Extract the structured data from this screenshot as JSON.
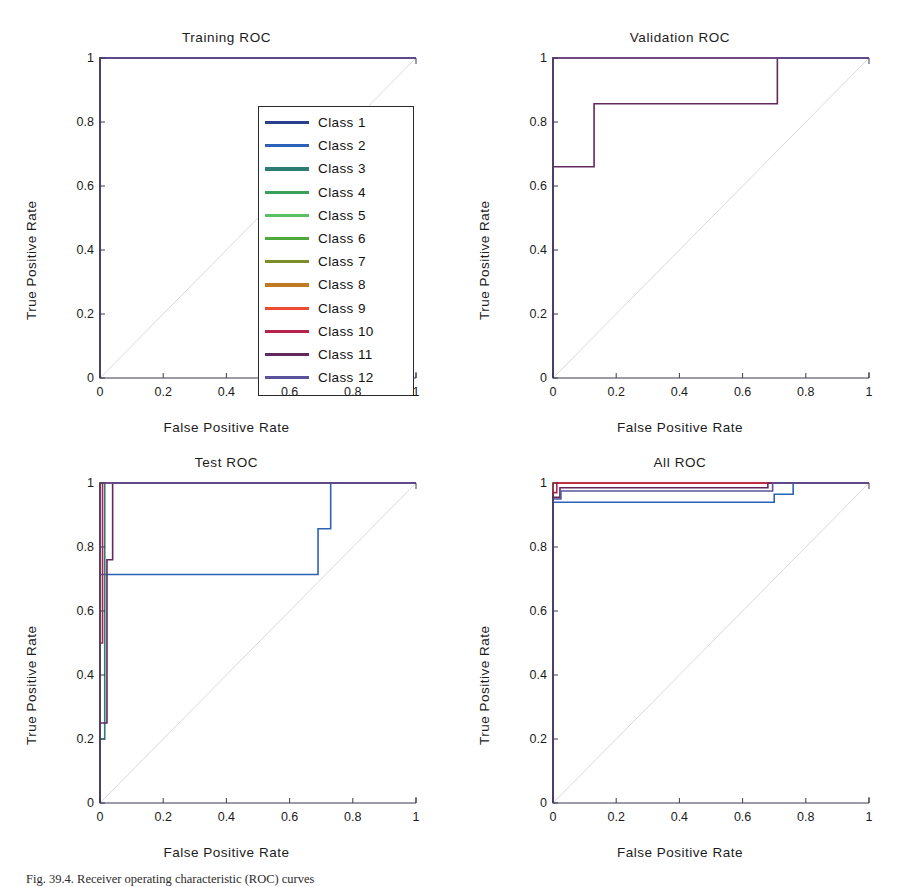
{
  "figure": {
    "caption": "Fig. 39.4. Receiver operating characteristic (ROC) curves",
    "width": 907,
    "height": 885
  },
  "axes": {
    "xlabel": "False Positive Rate",
    "ylabel": "True Positive Rate",
    "xticks": [
      "0",
      "0.2",
      "0.4",
      "0.6",
      "0.8",
      "1"
    ],
    "yticks": [
      "0",
      "0.2",
      "0.4",
      "0.6",
      "0.8",
      "1"
    ],
    "xlim": [
      0,
      1
    ],
    "ylim": [
      0,
      1
    ]
  },
  "legend": {
    "title": "",
    "items": [
      {
        "label": "Class 1",
        "color": "#2a3f8f"
      },
      {
        "label": "Class 2",
        "color": "#2b62b8"
      },
      {
        "label": "Class 3",
        "color": "#2e7d72"
      },
      {
        "label": "Class 4",
        "color": "#3aa05a"
      },
      {
        "label": "Class 5",
        "color": "#5cbf63"
      },
      {
        "label": "Class 6",
        "color": "#4fa83c"
      },
      {
        "label": "Class 7",
        "color": "#7b8c2a"
      },
      {
        "label": "Class 8",
        "color": "#c07a22"
      },
      {
        "label": "Class 9",
        "color": "#ef4b32"
      },
      {
        "label": "Class 10",
        "color": "#b5224c"
      },
      {
        "label": "Class 11",
        "color": "#62295e"
      },
      {
        "label": "Class 12",
        "color": "#5a539a"
      }
    ]
  },
  "chart_data": [
    {
      "id": "training",
      "type": "line",
      "title": "Training ROC",
      "xlabel": "False Positive Rate",
      "ylabel": "True Positive Rate",
      "xlim": [
        0,
        1
      ],
      "ylim": [
        0,
        1
      ],
      "grid": false,
      "legend_position": "inside-right",
      "diagonal_reference": true,
      "note": "All 12 class ROC curves are perfect: TPR jumps to 1 at FPR 0 and stays at 1.",
      "series": [
        {
          "name": "Class 1",
          "color": "#2a3f8f",
          "x": [
            0,
            0,
            1
          ],
          "y": [
            0,
            1,
            1
          ]
        },
        {
          "name": "Class 2",
          "color": "#2b62b8",
          "x": [
            0,
            0,
            1
          ],
          "y": [
            0,
            1,
            1
          ]
        },
        {
          "name": "Class 3",
          "color": "#2e7d72",
          "x": [
            0,
            0,
            1
          ],
          "y": [
            0,
            1,
            1
          ]
        },
        {
          "name": "Class 4",
          "color": "#3aa05a",
          "x": [
            0,
            0,
            1
          ],
          "y": [
            0,
            1,
            1
          ]
        },
        {
          "name": "Class 5",
          "color": "#5cbf63",
          "x": [
            0,
            0,
            1
          ],
          "y": [
            0,
            1,
            1
          ]
        },
        {
          "name": "Class 6",
          "color": "#4fa83c",
          "x": [
            0,
            0,
            1
          ],
          "y": [
            0,
            1,
            1
          ]
        },
        {
          "name": "Class 7",
          "color": "#7b8c2a",
          "x": [
            0,
            0,
            1
          ],
          "y": [
            0,
            1,
            1
          ]
        },
        {
          "name": "Class 8",
          "color": "#c07a22",
          "x": [
            0,
            0,
            1
          ],
          "y": [
            0,
            1,
            1
          ]
        },
        {
          "name": "Class 9",
          "color": "#ef4b32",
          "x": [
            0,
            0,
            1
          ],
          "y": [
            0,
            1,
            1
          ]
        },
        {
          "name": "Class 10",
          "color": "#b5224c",
          "x": [
            0,
            0,
            1
          ],
          "y": [
            0,
            1,
            1
          ]
        },
        {
          "name": "Class 11",
          "color": "#62295e",
          "x": [
            0,
            0,
            1
          ],
          "y": [
            0,
            1,
            1
          ]
        },
        {
          "name": "Class 12",
          "color": "#5a539a",
          "x": [
            0,
            0,
            1
          ],
          "y": [
            0,
            1,
            1
          ]
        }
      ]
    },
    {
      "id": "validation",
      "type": "line",
      "title": "Validation ROC",
      "xlabel": "False Positive Rate",
      "ylabel": "True Positive Rate",
      "xlim": [
        0,
        1
      ],
      "ylim": [
        0,
        1
      ],
      "grid": false,
      "legend_position": "none",
      "diagonal_reference": true,
      "note": "Most classes are perfect; Class 10 rises 0.66 -> 1 at FPR 0.13; Class 11 holds 0.857 until FPR 0.71.",
      "series": [
        {
          "name": "Class 1",
          "color": "#2a3f8f",
          "x": [
            0,
            0,
            1
          ],
          "y": [
            0,
            1,
            1
          ]
        },
        {
          "name": "Class 2",
          "color": "#2b62b8",
          "x": [
            0,
            0,
            1
          ],
          "y": [
            0,
            1,
            1
          ]
        },
        {
          "name": "Class 3",
          "color": "#2e7d72",
          "x": [
            0,
            0,
            1
          ],
          "y": [
            0,
            1,
            1
          ]
        },
        {
          "name": "Class 4",
          "color": "#3aa05a",
          "x": [
            0,
            0,
            1
          ],
          "y": [
            0,
            1,
            1
          ]
        },
        {
          "name": "Class 5",
          "color": "#5cbf63",
          "x": [
            0,
            0,
            1
          ],
          "y": [
            0,
            1,
            1
          ]
        },
        {
          "name": "Class 6",
          "color": "#4fa83c",
          "x": [
            0,
            0,
            1
          ],
          "y": [
            0,
            1,
            1
          ]
        },
        {
          "name": "Class 7",
          "color": "#7b8c2a",
          "x": [
            0,
            0,
            1
          ],
          "y": [
            0,
            1,
            1
          ]
        },
        {
          "name": "Class 8",
          "color": "#c07a22",
          "x": [
            0,
            0,
            1
          ],
          "y": [
            0,
            1,
            1
          ]
        },
        {
          "name": "Class 9",
          "color": "#ef4b32",
          "x": [
            0,
            0,
            1
          ],
          "y": [
            0,
            1,
            1
          ]
        },
        {
          "name": "Class 10",
          "color": "#b5224c",
          "x": [
            0,
            0,
            0,
            0.13,
            0.13,
            1
          ],
          "y": [
            0,
            0.66,
            1,
            1,
            1,
            1
          ]
        },
        {
          "name": "Class 11",
          "color": "#62295e",
          "x": [
            0,
            0,
            0.13,
            0.13,
            0.71,
            0.71,
            1
          ],
          "y": [
            0,
            0.66,
            0.66,
            0.857,
            0.857,
            1,
            1
          ]
        },
        {
          "name": "Class 12",
          "color": "#5a539a",
          "x": [
            0,
            0,
            1
          ],
          "y": [
            0,
            1,
            1
          ]
        }
      ]
    },
    {
      "id": "test",
      "type": "line",
      "title": "Test ROC",
      "xlabel": "False Positive Rate",
      "ylabel": "True Positive Rate",
      "xlim": [
        0,
        1
      ],
      "ylim": [
        0,
        1
      ],
      "grid": false,
      "legend_position": "none",
      "diagonal_reference": true,
      "note": "Class 2 plateaus at 0.714 until FPR 0.69, steps to 0.857, then to 1 at FPR 0.73. Several classes start at 0.2-0.5 and climb steeply near FPR 0.",
      "series": [
        {
          "name": "Class 1",
          "color": "#2a3f8f",
          "x": [
            0,
            0,
            1
          ],
          "y": [
            0,
            1,
            1
          ]
        },
        {
          "name": "Class 2",
          "color": "#2b62b8",
          "x": [
            0,
            0,
            0.04,
            0.04,
            0.69,
            0.69,
            0.73,
            0.73,
            1
          ],
          "y": [
            0,
            0.714,
            0.714,
            0.714,
            0.714,
            0.857,
            0.857,
            1,
            1
          ]
        },
        {
          "name": "Class 3",
          "color": "#2e7d72",
          "x": [
            0,
            0,
            0.015,
            0.015,
            1
          ],
          "y": [
            0,
            0.2,
            0.2,
            1,
            1
          ]
        },
        {
          "name": "Class 4",
          "color": "#3aa05a",
          "x": [
            0,
            0,
            1
          ],
          "y": [
            0,
            1,
            1
          ]
        },
        {
          "name": "Class 5",
          "color": "#5cbf63",
          "x": [
            0,
            0,
            1
          ],
          "y": [
            0,
            1,
            1
          ]
        },
        {
          "name": "Class 6",
          "color": "#4fa83c",
          "x": [
            0,
            0,
            1
          ],
          "y": [
            0,
            1,
            1
          ]
        },
        {
          "name": "Class 7",
          "color": "#7b8c2a",
          "x": [
            0,
            0,
            1
          ],
          "y": [
            0,
            1,
            1
          ]
        },
        {
          "name": "Class 8",
          "color": "#c07a22",
          "x": [
            0,
            0,
            1
          ],
          "y": [
            0,
            1,
            1
          ]
        },
        {
          "name": "Class 9",
          "color": "#ef4b32",
          "x": [
            0,
            0,
            1
          ],
          "y": [
            0,
            1,
            1
          ]
        },
        {
          "name": "Class 10",
          "color": "#b5224c",
          "x": [
            0,
            0,
            0.008,
            0.008,
            1
          ],
          "y": [
            0,
            0.5,
            0.5,
            1,
            1
          ]
        },
        {
          "name": "Class 11",
          "color": "#62295e",
          "x": [
            0,
            0,
            0.022,
            0.022,
            0.04,
            0.04,
            1
          ],
          "y": [
            0,
            0.25,
            0.25,
            0.76,
            0.76,
            1,
            1
          ]
        },
        {
          "name": "Class 12",
          "color": "#5a539a",
          "x": [
            0,
            0,
            1
          ],
          "y": [
            0,
            1,
            1
          ]
        }
      ]
    },
    {
      "id": "all",
      "type": "line",
      "title": "All ROC",
      "xlabel": "False Positive Rate",
      "ylabel": "True Positive Rate",
      "xlim": [
        0,
        1
      ],
      "ylim": [
        0,
        1
      ],
      "grid": false,
      "legend_position": "none",
      "diagonal_reference": true,
      "note": "Aggregated curves sit between 0.94 and 1.0, with small steps between FPR 0.68 and 0.76.",
      "series": [
        {
          "name": "Class 1",
          "color": "#2a3f8f",
          "x": [
            0,
            0,
            1
          ],
          "y": [
            0,
            1,
            1
          ]
        },
        {
          "name": "Class 2",
          "color": "#2b62b8",
          "x": [
            0,
            0,
            0.018,
            0.018,
            0.7,
            0.7,
            0.76,
            0.76,
            1
          ],
          "y": [
            0,
            0.94,
            0.94,
            0.94,
            0.94,
            0.965,
            0.965,
            1,
            1
          ]
        },
        {
          "name": "Class 3",
          "color": "#2e7d72",
          "x": [
            0,
            0,
            1
          ],
          "y": [
            0,
            1,
            1
          ]
        },
        {
          "name": "Class 4",
          "color": "#3aa05a",
          "x": [
            0,
            0,
            1
          ],
          "y": [
            0,
            1,
            1
          ]
        },
        {
          "name": "Class 5",
          "color": "#5cbf63",
          "x": [
            0,
            0,
            1
          ],
          "y": [
            0,
            1,
            1
          ]
        },
        {
          "name": "Class 6",
          "color": "#4fa83c",
          "x": [
            0,
            0,
            1
          ],
          "y": [
            0,
            1,
            1
          ]
        },
        {
          "name": "Class 7",
          "color": "#7b8c2a",
          "x": [
            0,
            0,
            1
          ],
          "y": [
            0,
            1,
            1
          ]
        },
        {
          "name": "Class 8",
          "color": "#c07a22",
          "x": [
            0,
            0,
            1
          ],
          "y": [
            0,
            1,
            1
          ]
        },
        {
          "name": "Class 9",
          "color": "#ef4b32",
          "x": [
            0,
            0,
            1
          ],
          "y": [
            0,
            1,
            1
          ]
        },
        {
          "name": "Class 10",
          "color": "#b5224c",
          "x": [
            0,
            0,
            0.012,
            0.012,
            1
          ],
          "y": [
            0,
            0.97,
            0.97,
            1,
            1
          ]
        },
        {
          "name": "Class 11",
          "color": "#62295e",
          "x": [
            0,
            0,
            0.022,
            0.022,
            0.68,
            0.68,
            1
          ],
          "y": [
            0,
            0.955,
            0.955,
            0.985,
            0.985,
            1,
            1
          ]
        },
        {
          "name": "Class 12",
          "color": "#5a539a",
          "x": [
            0,
            0,
            0.025,
            0.025,
            0.695,
            0.695,
            1
          ],
          "y": [
            0,
            0.95,
            0.95,
            0.975,
            0.975,
            1,
            1
          ]
        }
      ]
    }
  ]
}
